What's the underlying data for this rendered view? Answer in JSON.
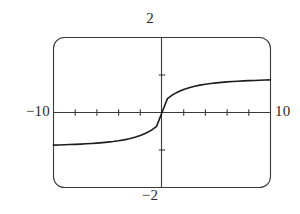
{
  "chart_data": {
    "type": "line",
    "title": "",
    "subtitle": "",
    "xlabel": "",
    "ylabel": "",
    "xlim": [
      -10,
      10
    ],
    "ylim": [
      -2,
      2
    ],
    "grid": false,
    "legend": null,
    "frame": {
      "style": "rounded-rectangle",
      "color": "#3a3a3a"
    },
    "axes": {
      "x_axis_at_y": 0,
      "y_axis_at_x": 0,
      "x_tick_values": [
        -8,
        -6,
        -4,
        -2,
        2,
        4,
        6,
        8
      ],
      "y_tick_values": [
        -1,
        1
      ],
      "tick_labels_shown": false
    },
    "window_labels": {
      "ymax": "2",
      "ymin": "−2",
      "xmin": "−10",
      "xmax": "10"
    },
    "series": [
      {
        "name": "sigmoid curve",
        "color": "#1c1c1c",
        "line_width": 1.6,
        "x": [
          -10,
          -9.5,
          -9,
          -8.5,
          -8,
          -7.5,
          -7,
          -6.5,
          -6,
          -5.5,
          -5,
          -4.5,
          -4,
          -3.5,
          -3,
          -2.5,
          -2,
          -1.5,
          -1,
          -0.5,
          0,
          0.5,
          1,
          1.5,
          2,
          2.5,
          3,
          3.5,
          4,
          4.5,
          5,
          5.5,
          6,
          6.5,
          7,
          7.5,
          8,
          8.5,
          9,
          9.5,
          10
        ],
        "y": [
          -0.87,
          -0.865,
          -0.86,
          -0.855,
          -0.85,
          -0.843,
          -0.835,
          -0.826,
          -0.816,
          -0.804,
          -0.79,
          -0.774,
          -0.754,
          -0.73,
          -0.699,
          -0.662,
          -0.614,
          -0.555,
          -0.477,
          -0.37,
          0,
          0.37,
          0.477,
          0.555,
          0.614,
          0.662,
          0.699,
          0.73,
          0.754,
          0.774,
          0.79,
          0.804,
          0.816,
          0.826,
          0.835,
          0.843,
          0.85,
          0.855,
          0.86,
          0.865,
          0.87
        ]
      }
    ]
  }
}
